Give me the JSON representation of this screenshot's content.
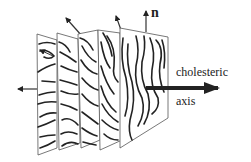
{
  "figure": {
    "type": "cholesteric liquid crystal layer diagram",
    "plane_count": 5,
    "labels": {
      "director": "n",
      "axis_line1": "cholesteric",
      "axis_line2": "axis"
    },
    "colors": {
      "line": "#222222",
      "plane_edge": "#555555",
      "background": "#ffffff"
    }
  }
}
